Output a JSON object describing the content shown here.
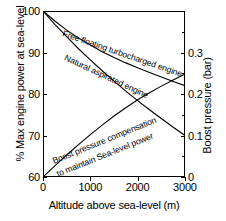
{
  "chart_data": {
    "type": "line",
    "title": "",
    "xlabel": "Altitude above sea-level (m)",
    "ylabel": "% Max engine power at sea-level",
    "y2label": "Boost pressure (bar)",
    "xlim": [
      0,
      3000
    ],
    "ylim": [
      60,
      100
    ],
    "y2lim": [
      0,
      0.4
    ],
    "grid": false,
    "legend": "inline-curve-labels",
    "xticks": [
      "0",
      "1000",
      "2000",
      "3000"
    ],
    "xtick_values": [
      0,
      1000,
      2000,
      3000
    ],
    "yticks": [
      "60",
      "70",
      "80",
      "90",
      "100"
    ],
    "ytick_values": [
      60,
      70,
      80,
      90,
      100
    ],
    "y2ticks": [
      "0",
      "0.1",
      "0.2",
      "0.3"
    ],
    "y2tick_values": [
      0,
      0.1,
      0.2,
      0.3
    ],
    "series": [
      {
        "name": "Free floating turbocharged engine",
        "axis": "left",
        "x": [
          0,
          250,
          500,
          750,
          1000,
          1250,
          1500,
          1750,
          2000,
          2250,
          2500,
          2750,
          3000
        ],
        "values": [
          100,
          97.6,
          95.4,
          93.5,
          91.8,
          90.2,
          88.8,
          87.5,
          86.3,
          85.2,
          84.1,
          83.0,
          82.0
        ]
      },
      {
        "name": "Natural aspirated engine",
        "axis": "left",
        "x": [
          0,
          250,
          500,
          750,
          1000,
          1250,
          1500,
          1750,
          2000,
          2250,
          2500,
          2750,
          3000
        ],
        "values": [
          100,
          96.8,
          93.8,
          90.9,
          88.2,
          85.6,
          83.1,
          80.7,
          78.4,
          76.2,
          74.1,
          72.0,
          70.0
        ]
      },
      {
        "name": "Boost pressure compensation to maintain Sea-level power",
        "axis": "right",
        "x": [
          0,
          250,
          500,
          750,
          1000,
          1250,
          1500,
          1750,
          2000,
          2250,
          2500,
          2750,
          3000
        ],
        "values": [
          0.0,
          0.027,
          0.053,
          0.078,
          0.102,
          0.125,
          0.147,
          0.167,
          0.186,
          0.203,
          0.219,
          0.234,
          0.248
        ]
      }
    ],
    "annotations": [
      {
        "text": "Free floating turbocharged engine",
        "series": 0
      },
      {
        "text": "Natural aspirated engine",
        "series": 1
      },
      {
        "text": "Boost pressure compensation",
        "series": 2
      },
      {
        "text": "to maintain Sea-level power",
        "series": 2
      }
    ],
    "colors": {
      "line": "#000000",
      "background": "#ffffff",
      "axis": "#000000"
    }
  },
  "axes": {
    "left_title": "% Max engine power at sea-level",
    "right_title": "Boost pressure (bar)",
    "bottom_title": "Altitude above sea-level (m)"
  },
  "labels": {
    "y_100": "100",
    "y_90": "90",
    "y_80": "80",
    "y_70": "70",
    "y_60": "60",
    "x_0": "0",
    "x_1000": "1000",
    "x_2000": "2000",
    "x_3000": "3000",
    "y2_03": "0.3",
    "y2_02": "0.2",
    "y2_01": "0.1",
    "y2_0": "0"
  },
  "annotations": {
    "turbo": "Free floating turbocharged engine",
    "natural": "Natural aspirated engine",
    "boost_line1": "Boost pressure compensation",
    "boost_line2": "to maintain Sea-level power"
  }
}
